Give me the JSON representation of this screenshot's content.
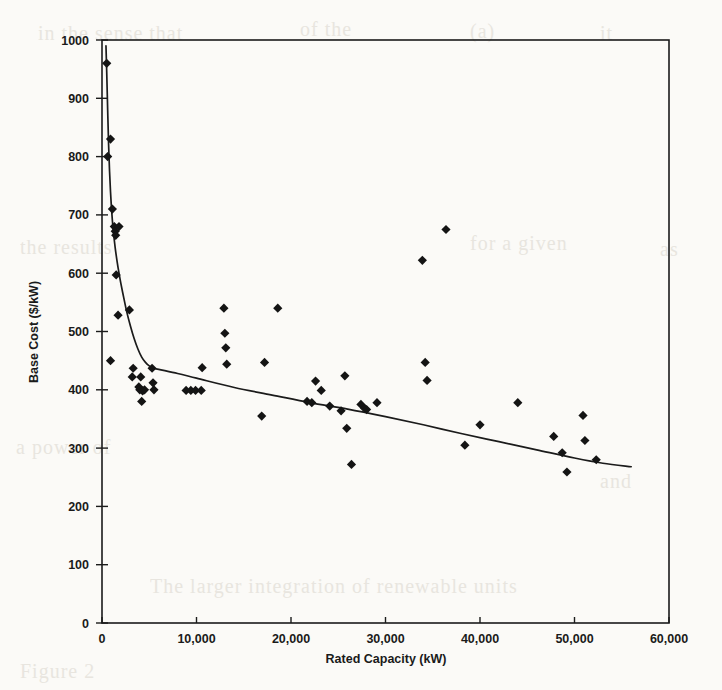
{
  "figure": {
    "background_color": "#fbfaf7",
    "ink_color": "#141414"
  },
  "ghost_text": [
    {
      "text": "in the sense that",
      "x": 38,
      "y": 22
    },
    {
      "text": "of the",
      "x": 300,
      "y": 18
    },
    {
      "text": "(a)",
      "x": 470,
      "y": 20
    },
    {
      "text": "it",
      "x": 600,
      "y": 22
    },
    {
      "text": "the results",
      "x": 20,
      "y": 236
    },
    {
      "text": "for  a  given",
      "x": 470,
      "y": 232
    },
    {
      "text": "as",
      "x": 660,
      "y": 238
    },
    {
      "text": "a  power  of",
      "x": 16,
      "y": 436
    },
    {
      "text": "and",
      "x": 600,
      "y": 470
    },
    {
      "text": "The  larger  integration  of  renewable  units",
      "x": 150,
      "y": 575
    },
    {
      "text": "Figure 2",
      "x": 20,
      "y": 660
    }
  ],
  "chart_data": {
    "type": "scatter",
    "title": "",
    "xlabel": "Rated Capacity (kW)",
    "ylabel": "Base Cost ($/kW)",
    "xlim": [
      0,
      60000
    ],
    "ylim": [
      0,
      1000
    ],
    "xticks": [
      0,
      10000,
      20000,
      30000,
      40000,
      50000,
      60000
    ],
    "xtick_labels": [
      "0",
      "10,000",
      "20,000",
      "30,000",
      "40,000",
      "50,000",
      "60,000"
    ],
    "yticks": [
      0,
      100,
      200,
      300,
      400,
      500,
      600,
      700,
      800,
      900,
      1000
    ],
    "ytick_labels": [
      "0",
      "100",
      "200",
      "300",
      "400",
      "500",
      "600",
      "700",
      "800",
      "900",
      "1000"
    ],
    "grid": false,
    "legend": null,
    "marker": "diamond",
    "series": [
      {
        "name": "Base Cost vs Rated Capacity",
        "marker": "diamond",
        "color": "#141414",
        "points": [
          [
            500,
            960
          ],
          [
            600,
            800
          ],
          [
            900,
            830
          ],
          [
            1100,
            710
          ],
          [
            1300,
            680
          ],
          [
            1400,
            672
          ],
          [
            1450,
            665
          ],
          [
            1800,
            680
          ],
          [
            1500,
            597
          ],
          [
            900,
            450
          ],
          [
            1700,
            528
          ],
          [
            2900,
            537
          ],
          [
            3300,
            437
          ],
          [
            3200,
            422
          ],
          [
            4100,
            422
          ],
          [
            3900,
            405
          ],
          [
            4000,
            400
          ],
          [
            4300,
            398
          ],
          [
            4500,
            400
          ],
          [
            4200,
            380
          ],
          [
            5300,
            437
          ],
          [
            5400,
            412
          ],
          [
            5500,
            400
          ],
          [
            8900,
            399
          ],
          [
            9400,
            399
          ],
          [
            9900,
            399
          ],
          [
            10500,
            399
          ],
          [
            10600,
            438
          ],
          [
            12900,
            540
          ],
          [
            13000,
            497
          ],
          [
            13100,
            472
          ],
          [
            13200,
            444
          ],
          [
            16900,
            355
          ],
          [
            17200,
            447
          ],
          [
            18600,
            540
          ],
          [
            21700,
            380
          ],
          [
            22200,
            378
          ],
          [
            22600,
            415
          ],
          [
            23200,
            399
          ],
          [
            24100,
            372
          ],
          [
            25300,
            364
          ],
          [
            25700,
            424
          ],
          [
            25900,
            334
          ],
          [
            26400,
            272
          ],
          [
            27400,
            375
          ],
          [
            27800,
            368
          ],
          [
            28000,
            366
          ],
          [
            29100,
            378
          ],
          [
            33900,
            622
          ],
          [
            34200,
            447
          ],
          [
            34400,
            416
          ],
          [
            36400,
            675
          ],
          [
            38400,
            305
          ],
          [
            40000,
            340
          ],
          [
            44000,
            378
          ],
          [
            47800,
            320
          ],
          [
            48700,
            292
          ],
          [
            49200,
            259
          ],
          [
            50900,
            356
          ],
          [
            51100,
            313
          ],
          [
            52300,
            280
          ]
        ]
      }
    ],
    "fit_curve": {
      "name": "fitted trend",
      "color": "#1b1b1b",
      "points": [
        [
          420,
          990
        ],
        [
          500,
          945
        ],
        [
          600,
          880
        ],
        [
          700,
          820
        ],
        [
          800,
          775
        ],
        [
          900,
          740
        ],
        [
          1000,
          712
        ],
        [
          1100,
          690
        ],
        [
          1200,
          672
        ],
        [
          1400,
          643
        ],
        [
          1600,
          620
        ],
        [
          1800,
          600
        ],
        [
          2000,
          582
        ],
        [
          2300,
          558
        ],
        [
          2600,
          535
        ],
        [
          3000,
          510
        ],
        [
          3400,
          488
        ],
        [
          3800,
          470
        ],
        [
          4200,
          456
        ],
        [
          4600,
          447
        ],
        [
          5000,
          441
        ],
        [
          5500,
          437
        ],
        [
          6000,
          435
        ],
        [
          8000,
          428
        ],
        [
          10000,
          420
        ],
        [
          14000,
          404
        ],
        [
          18000,
          391
        ],
        [
          22000,
          378
        ],
        [
          26000,
          367
        ],
        [
          30000,
          354
        ],
        [
          34000,
          340
        ],
        [
          38000,
          325
        ],
        [
          42000,
          311
        ],
        [
          46000,
          297
        ],
        [
          50000,
          283
        ],
        [
          53000,
          274
        ],
        [
          56000,
          268
        ]
      ]
    }
  }
}
